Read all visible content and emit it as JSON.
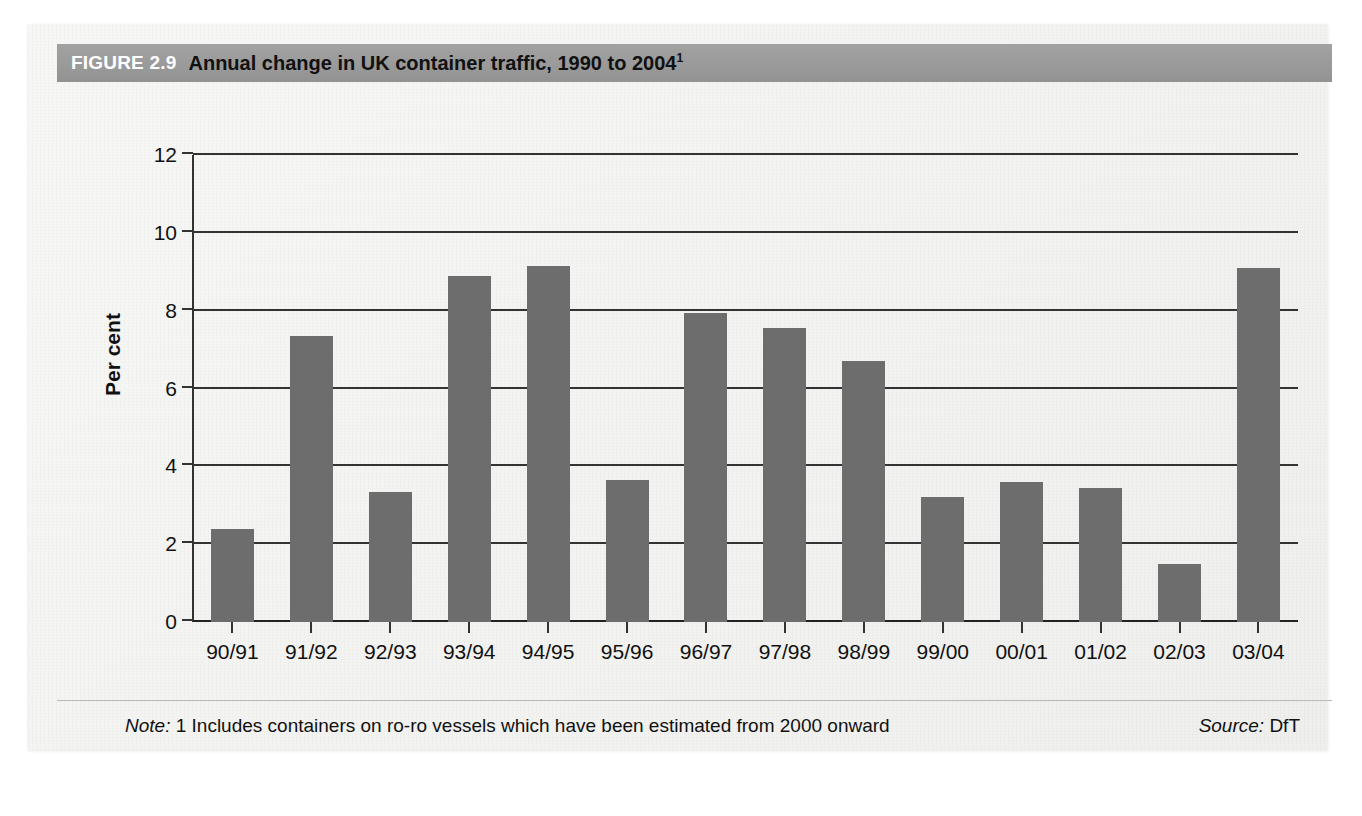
{
  "figure": {
    "number_label": "FIGURE 2.9",
    "title": "Annual change in UK container traffic, 1990 to 2004",
    "title_superscript": "1"
  },
  "footer": {
    "note_label": "Note:",
    "note_text": "1 Includes containers on ro-ro vessels which have been estimated from 2000 onward",
    "source_label": "Source:",
    "source_text": "DfT"
  },
  "colors": {
    "bar_fill": "#6d6d6d",
    "title_bar": "#9a9a9a",
    "axis": "#333333",
    "page_background": "#f4f4f2"
  },
  "chart_data": {
    "type": "bar",
    "title": "Annual change in UK container traffic, 1990 to 2004",
    "xlabel": "",
    "ylabel": "Per cent",
    "ylim": [
      0,
      12
    ],
    "yticks": [
      0,
      2,
      4,
      6,
      8,
      10,
      12
    ],
    "ytick_labels": [
      "0",
      "2",
      "4",
      "6",
      "8",
      "10",
      "12"
    ],
    "grid": "horizontal",
    "legend": "none",
    "categories": [
      "90/91",
      "91/92",
      "92/93",
      "93/94",
      "94/95",
      "95/96",
      "96/97",
      "97/98",
      "98/99",
      "99/00",
      "00/01",
      "01/02",
      "02/03",
      "03/04"
    ],
    "values": [
      2.4,
      7.35,
      3.35,
      8.9,
      9.15,
      3.65,
      7.95,
      7.55,
      6.7,
      3.2,
      3.6,
      3.45,
      1.5,
      9.1
    ],
    "series": [
      {
        "name": "Annual change in UK container traffic",
        "values": [
          2.4,
          7.35,
          3.35,
          8.9,
          9.15,
          3.65,
          7.95,
          7.55,
          6.7,
          3.2,
          3.6,
          3.45,
          1.5,
          9.1
        ]
      }
    ]
  }
}
